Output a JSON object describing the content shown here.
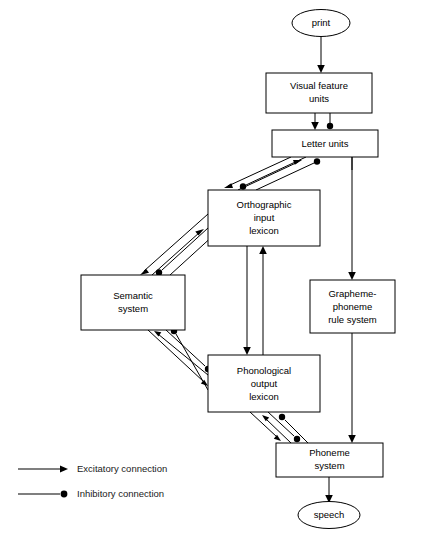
{
  "figure": {
    "caption": ""
  },
  "nodes": {
    "print": {
      "label": "print",
      "shape": "ellipse"
    },
    "visual_feature_units": {
      "label_line1": "Visual feature",
      "label_line2": "units",
      "shape": "box"
    },
    "letter_units": {
      "label_line1": "Letter units",
      "shape": "box"
    },
    "orthographic_input_lexicon": {
      "label_line1": "Orthographic",
      "label_line2": "input",
      "label_line3": "lexicon",
      "shape": "box"
    },
    "semantic_system": {
      "label_line1": "Semantic",
      "label_line2": "system",
      "shape": "box"
    },
    "grapheme_phoneme_rule_system": {
      "label_line1": "Grapheme-",
      "label_line2": "phoneme",
      "label_line3": "rule system",
      "shape": "box"
    },
    "phonological_output_lexicon": {
      "label_line1": "Phonological",
      "label_line2": "output",
      "label_line3": "lexicon",
      "shape": "box"
    },
    "phoneme_system": {
      "label_line1": "Phoneme",
      "label_line2": "system",
      "shape": "box"
    },
    "speech": {
      "label": "speech",
      "shape": "ellipse"
    }
  },
  "legend": {
    "items": [
      {
        "key": "excitatory",
        "label": "Excitatory connection",
        "marker": "arrow"
      },
      {
        "key": "inhibitory",
        "label": "Inhibitory connection",
        "marker": "dot"
      }
    ]
  },
  "colors": {
    "stroke": "#000000",
    "fill": "#ffffff",
    "text": "#000000",
    "caption": "#444444"
  }
}
